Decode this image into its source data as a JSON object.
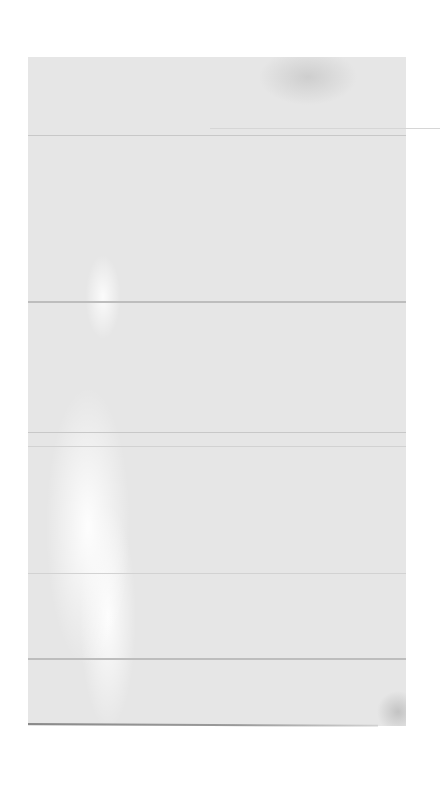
{
  "page": {
    "type": "blank scanned page",
    "visible_text": ""
  },
  "colors": {
    "background": "#ffffff",
    "panel": "#e6e6e6",
    "rules": "#c8c8c8",
    "bottom_edge": "#8a8a8a"
  }
}
